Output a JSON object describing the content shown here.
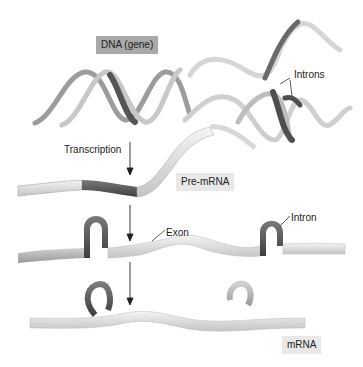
{
  "diagram": {
    "title_label": "DNA (gene)",
    "labels": {
      "dna": "DNA (gene)",
      "introns": "Introns",
      "transcription": "Transcription",
      "pre_mrna": "Pre-mRNA",
      "exon": "Exon",
      "intron": "Intron",
      "mrna": "mRNA"
    },
    "stages": [
      "DNA (gene)",
      "Pre-mRNA",
      "Spliced (Exon / Intron)",
      "mRNA"
    ],
    "colors": {
      "ribbon_light": "#e2e2e2",
      "ribbon_mid": "#b8b8b8",
      "ribbon_dark": "#5a5a5a",
      "label_box_dark": "#a9a9a9",
      "label_box_light": "#e8e8e8"
    }
  }
}
